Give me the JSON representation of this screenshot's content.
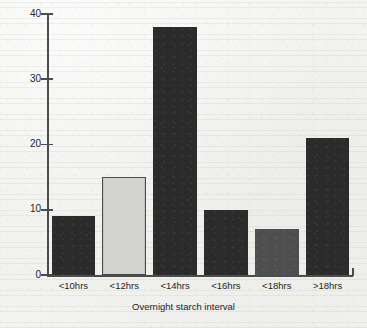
{
  "chart_data": {
    "type": "bar",
    "title": "",
    "xlabel": "Overnight starch interval",
    "ylabel": "",
    "categories": [
      "<10hrs",
      "<12hrs",
      "<14hrs",
      "<16hrs",
      "<18hrs",
      ">18hrs"
    ],
    "values": [
      9,
      15,
      38,
      10,
      7,
      21
    ],
    "bar_colors": [
      "#2b2b2b",
      "#d2d2d0",
      "#2b2b2b",
      "#2b2b2b",
      "#4e4e4e",
      "#2b2b2b"
    ],
    "bar_edge_colors": [
      "#2b2b2b",
      "#4a4a4a",
      "#2b2b2b",
      "#2b2b2b",
      "#4e4e4e",
      "#2b2b2b"
    ],
    "ylim": [
      0,
      40
    ],
    "yticks": [
      0,
      10,
      20,
      30,
      40
    ],
    "ytick_labels": [
      "0",
      "10",
      "20",
      "30",
      "40"
    ],
    "grid": false,
    "legend": "none"
  },
  "axes": {
    "axis_color": "#4c4c4c"
  }
}
